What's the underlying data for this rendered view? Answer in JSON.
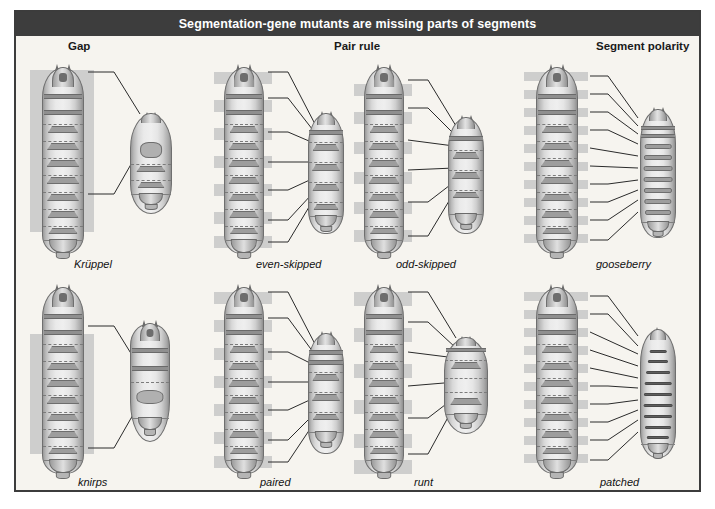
{
  "figure": {
    "title": "Segmentation-gene mutants are missing parts of segments",
    "title_bar_color": "#3d3d3d",
    "panel_background": "#f6f4ef",
    "border_color": "#3c3c3c",
    "highlight_color": "#c7c7c7"
  },
  "columns": [
    {
      "id": "gap",
      "label": "Gap"
    },
    {
      "id": "pair",
      "label": "Pair rule"
    },
    {
      "id": "segment",
      "label": "Segment polarity"
    }
  ],
  "panels": [
    {
      "id": "kruppel",
      "label": "Krüppel",
      "column": "gap",
      "row": 1,
      "class": "gap",
      "description": "Wild-type larva at left with a single contiguous gray block over the thoracic and anterior abdominal segments; mutant larva at right is short and ovoid with those segments deleted.",
      "highlight_style": "one large contiguous block",
      "mutant_shape": "ovoid-short",
      "leader_lines": 2
    },
    {
      "id": "even-skipped",
      "label": "even-skipped",
      "column": "pair",
      "row": 1,
      "class": "pair-rule",
      "description": "Wild-type larva with alternating gray bands marking every other segment; mutant larva retains only the alternate segments.",
      "highlight_style": "alternating bands",
      "mutant_shape": "narrow-short",
      "leader_lines": 7
    },
    {
      "id": "odd-skipped",
      "label": "odd-skipped",
      "column": "pair",
      "row": 1,
      "class": "pair-rule",
      "description": "Wild-type larva with alternating gray bands offset by one segment from even-skipped; mutant larva is shortened with alternate segments missing.",
      "highlight_style": "alternating bands (offset)",
      "mutant_shape": "narrow-short",
      "leader_lines": 6
    },
    {
      "id": "gooseberry",
      "label": "gooseberry",
      "column": "segment",
      "row": 1,
      "class": "segment-polarity",
      "description": "Wild-type larva with a narrow gray band on every segment; mutant larva is shortened with every segment showing mirror-image denticle bands.",
      "highlight_style": "narrow band on every segment",
      "mutant_shape": "narrow-striped",
      "leader_lines": 10
    },
    {
      "id": "knirps",
      "label": "knirps",
      "column": "gap",
      "row": 2,
      "class": "gap",
      "description": "Wild-type larva with one large gray block over the abdominal segments; mutant larva is short with a smooth abdominal region lacking those segments.",
      "highlight_style": "one large contiguous block",
      "mutant_shape": "pear-short",
      "leader_lines": 2
    },
    {
      "id": "paired",
      "label": "paired",
      "column": "pair",
      "row": 2,
      "class": "pair-rule",
      "description": "Wild-type larva with alternating gray bands; mutant larva has half the usual number of denticle belts.",
      "highlight_style": "alternating bands",
      "mutant_shape": "narrow-short",
      "leader_lines": 7
    },
    {
      "id": "runt",
      "label": "runt",
      "column": "pair",
      "row": 2,
      "class": "pair-rule",
      "description": "Wild-type larva with alternating gray bands; mutant larva is very short and broad with only a few denticle belts remaining.",
      "highlight_style": "alternating bands",
      "mutant_shape": "broad-short",
      "leader_lines": 6
    },
    {
      "id": "patched",
      "label": "patched",
      "column": "segment",
      "row": 2,
      "class": "segment-polarity",
      "description": "Wild-type larva with a narrow gray band on every segment; mutant larva is shortened with dark denticle bars on every segment.",
      "highlight_style": "narrow band on every segment",
      "mutant_shape": "narrow-striped-dark",
      "leader_lines": 10
    }
  ]
}
